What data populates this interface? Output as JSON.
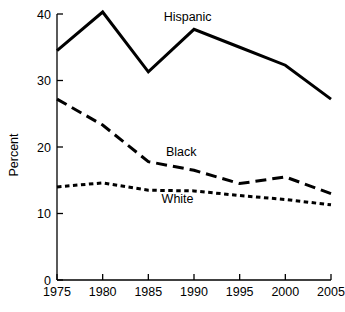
{
  "chart_data": {
    "type": "line",
    "title": "",
    "xlabel": "",
    "ylabel": "Percent",
    "x": [
      1975,
      1980,
      1985,
      1990,
      1995,
      2000,
      2005
    ],
    "xtick_labels": [
      "1975",
      "1980",
      "1985",
      "1990",
      "1995",
      "2000",
      "2005"
    ],
    "ytick_labels": [
      "0",
      "10",
      "20",
      "30",
      "40"
    ],
    "yticks": [
      0,
      10,
      20,
      30,
      40
    ],
    "ylim": [
      0,
      42
    ],
    "xlim": [
      1975,
      2005
    ],
    "grid": false,
    "legend_position": "inline-annotations",
    "series": [
      {
        "name": "Hispanic",
        "style": "solid",
        "color": "#000000",
        "values": [
          34.5,
          40.3,
          31.3,
          37.7,
          35.0,
          32.3,
          27.2
        ],
        "label_x": 1989.3,
        "label_y": 39.0
      },
      {
        "name": "Black",
        "style": "long-dash",
        "color": "#000000",
        "values": [
          27.2,
          23.3,
          17.8,
          16.5,
          14.5,
          15.5,
          13.0
        ],
        "label_x": 1988.6,
        "label_y": 18.6
      },
      {
        "name": "White",
        "style": "short-dash",
        "color": "#000000",
        "values": [
          14.0,
          14.6,
          13.5,
          13.4,
          12.7,
          12.1,
          11.3
        ],
        "label_x": 1988.2,
        "label_y": 11.6
      }
    ],
    "annotations": [
      {
        "text": "Hispanic",
        "series": "Hispanic"
      },
      {
        "text": "Black",
        "series": "Black"
      },
      {
        "text": "White",
        "series": "White"
      }
    ]
  }
}
